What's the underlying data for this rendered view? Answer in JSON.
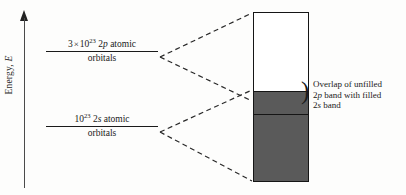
{
  "figure": {
    "background_color": "#fdfdfc",
    "width": 406,
    "height": 195
  },
  "axis": {
    "label_prefix": "Energy, ",
    "label_symbol": "E",
    "arrow_direction": "up",
    "color": "#4a4a4a"
  },
  "levels": [
    {
      "id": "2p",
      "coefficient": "3",
      "multiplication_sign": "×",
      "mantissa": "10",
      "exponent": "23",
      "orbital_symbol": "2",
      "orbital_letter": "p",
      "descriptor": "atomic",
      "second_line": "orbitals",
      "rule_color": "#1a1a1a"
    },
    {
      "id": "2s",
      "coefficient": "",
      "multiplication_sign": "",
      "mantissa": "10",
      "exponent": "23",
      "orbital_symbol": "2",
      "orbital_letter": "s",
      "descriptor": "atomic",
      "second_line": "orbitals",
      "rule_color": "#1a1a1a"
    }
  ],
  "band": {
    "border_color": "#151515",
    "unfilled_color": "#ffffff",
    "overlap_color": "#5a5a5a",
    "filled_color": "#5a5a5a",
    "segments": [
      {
        "name": "unfilled-2p-band",
        "fill": "#ffffff"
      },
      {
        "name": "overlap-band",
        "fill": "#5a5a5a"
      },
      {
        "name": "filled-2s-band",
        "fill": "#5a5a5a"
      }
    ]
  },
  "annotation": {
    "brace": ")",
    "line1": "Overlap of unfilled",
    "line2_prefix": "2",
    "line2_italic": "p",
    "line2_suffix": " band with filled",
    "line3_prefix": "2",
    "line3_italic": "s",
    "line3_suffix": " band"
  },
  "connectors": {
    "color": "#2a2a2a",
    "style": "dashed",
    "dash_pattern": "5,3.5"
  }
}
